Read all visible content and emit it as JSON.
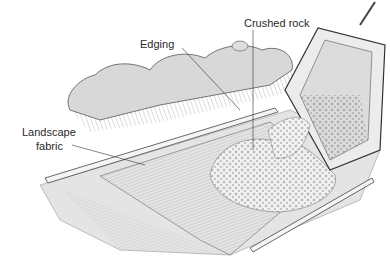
{
  "illustration": {
    "subject": "Pouring crushed rock from wheelbarrow onto landscape fabric between edging",
    "labels": {
      "edging": "Edging",
      "crushed_rock": "Crushed rock",
      "landscape_fabric_line1": "Landscape",
      "landscape_fabric_line2": "fabric"
    }
  }
}
